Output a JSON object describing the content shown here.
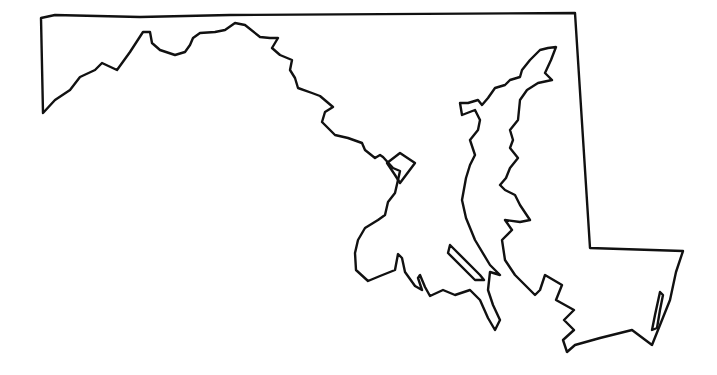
{
  "map": {
    "subject": "Maryland state outline",
    "style": "black outline on white background",
    "stroke_color": "#111111",
    "background_color": "#ffffff",
    "labels": []
  },
  "shapes": {
    "mainland": "M41,18 L55,15 L140,17 L230,15 L575,13 L590,248 L683,251 L676,272 L670,300 L660,325 L652,345 L632,330 L600,338 L575,345 L567,352 L563,340 L574,330 L564,320 L574,310 L556,300 L562,285 L545,275 L540,290 L535,295 L525,285 L515,275 L505,260 L502,240 L512,230 L505,220 L520,222 L530,220 L520,205 L515,195 L505,190 L500,185 L506,178 L510,168 L518,158 L510,148 L513,140 L510,130 L518,120 L520,100 L527,90 L538,83 L552,80 L545,73 L551,60 L556,47 L548,48 L540,50 L530,60 L522,70 L520,77 L510,80 L505,85 L495,88 L488,98 L482,105 L478,100 L468,103 L460,103 L462,115 L475,110 L480,120 L478,130 L470,140 L475,155 L470,165 L466,178 L462,200 L466,218 L475,240 L490,265 L500,275 L490,272 L488,290 L493,305 L500,320 L495,330 L488,318 L480,300 L470,290 L455,295 L443,290 L430,296 L425,287 L420,275 L418,278 L422,290 L415,286 L405,272 L402,258 L398,254 L395,270 L380,276 L368,281 L356,270 L355,253 L358,240 L365,228 L378,220 L385,215 L388,202 L395,193 L398,180 L400,171 L393,168 L383,157 L380,155 L375,158 L365,150 L362,143 L348,138 L335,135 L322,122 L325,112 L333,107 L320,96 L312,93 L298,88 L295,78 L290,70 L292,60 L280,55 L272,48 L278,38 L270,38 L260,37 L245,25 L235,23 L225,30 L215,32 L200,33 L193,38 L190,45 L185,52 L175,55 L160,50 L152,43 L150,32 L143,32 L130,52 L117,70 L102,63 L95,70 L80,77 L70,90 L55,100 L43,113 Z",
    "delmarva_inner": "M400,153 L415,163 L400,183 L395,175 L387,163 Z",
    "island_south": "M450,245 L455,250 L480,275 L484,280 L475,280 L448,253 Z",
    "island_east": "M660,292 L663,295 L660,310 L657,328 L652,330 L655,315 Z"
  }
}
